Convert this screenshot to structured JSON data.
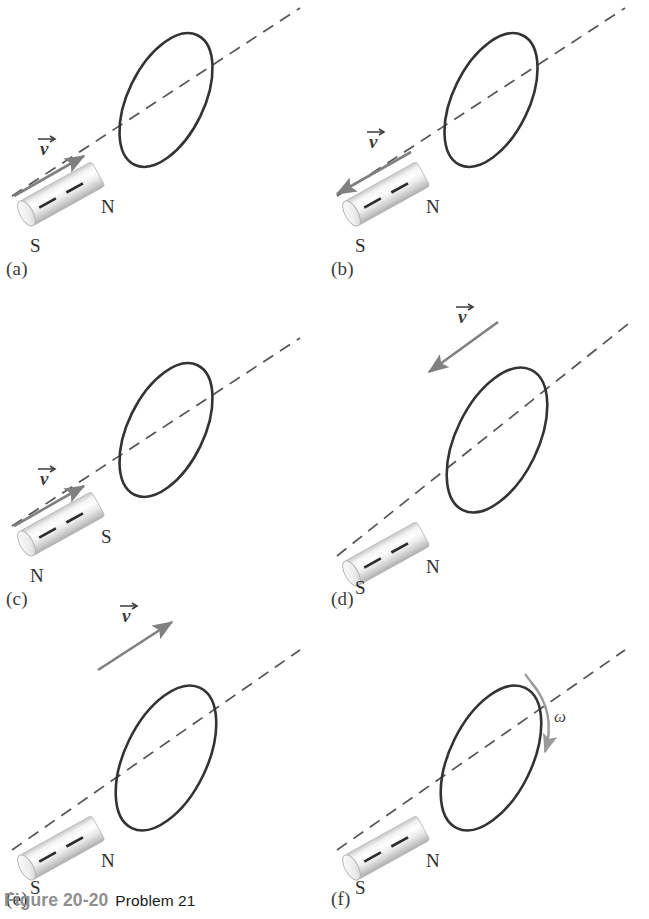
{
  "figure": {
    "caption_figure": "Figure 20-20",
    "caption_problem": "Problem 21",
    "caption_figure_color": "#8f8f8f",
    "caption_problem_color": "#1a1a1a"
  },
  "style": {
    "loop_color": "#333333",
    "axis_color": "#555555",
    "arrow_color": "#808080",
    "magnet_body_light": "#ffffff",
    "magnet_body_mid": "#e2e2e2",
    "magnet_body_dark": "#b5b5b5",
    "magnet_stripe": "#2b2b2b",
    "pole_label_color": "#2e2e2e",
    "panel_label_color": "#3b3b3b",
    "background": "#ffffff"
  },
  "symbols": {
    "velocity": "v",
    "omega": "ω",
    "pole_north": "N",
    "pole_south": "S"
  },
  "panels": [
    {
      "id": "a",
      "label": "(a)",
      "magnet": {
        "near_pole": "S",
        "far_pole": "N",
        "near_pole_label": "S",
        "far_pole_label": "N"
      },
      "motion": {
        "type": "velocity",
        "symbol": "v",
        "attached_to": "magnet",
        "direction": "toward-loop-up-right",
        "description": "Magnet moves toward the loop"
      },
      "loop": {
        "present": true,
        "moving": false
      }
    },
    {
      "id": "b",
      "label": "(b)",
      "magnet": {
        "near_pole": "S",
        "far_pole": "N",
        "near_pole_label": "S",
        "far_pole_label": "N"
      },
      "motion": {
        "type": "velocity",
        "symbol": "v",
        "attached_to": "magnet",
        "direction": "away-from-loop-down-left",
        "description": "Magnet moves away from the loop"
      },
      "loop": {
        "present": true,
        "moving": false
      }
    },
    {
      "id": "c",
      "label": "(c)",
      "magnet": {
        "near_pole": "N",
        "far_pole": "S",
        "near_pole_label": "N",
        "far_pole_label": "S"
      },
      "motion": {
        "type": "velocity",
        "symbol": "v",
        "attached_to": "magnet",
        "direction": "toward-loop-up-right",
        "description": "Reversed magnet moves toward the loop"
      },
      "loop": {
        "present": true,
        "moving": false
      }
    },
    {
      "id": "d",
      "label": "(d)",
      "magnet": {
        "near_pole": "S",
        "far_pole": "N",
        "near_pole_label": "S",
        "far_pole_label": "N"
      },
      "motion": {
        "type": "velocity",
        "symbol": "v",
        "attached_to": "loop",
        "direction": "toward-magnet-down-left",
        "description": "Loop moves toward the magnet"
      },
      "loop": {
        "present": true,
        "moving": true
      }
    },
    {
      "id": "e",
      "label": "(e)",
      "magnet": {
        "near_pole": "S",
        "far_pole": "N",
        "near_pole_label": "S",
        "far_pole_label": "N"
      },
      "motion": {
        "type": "velocity",
        "symbol": "v",
        "attached_to": "loop",
        "direction": "away-from-magnet-up-right",
        "description": "Loop moves away from the magnet"
      },
      "loop": {
        "present": true,
        "moving": true
      }
    },
    {
      "id": "f",
      "label": "(f)",
      "magnet": {
        "near_pole": "S",
        "far_pole": "N",
        "near_pole_label": "S",
        "far_pole_label": "N"
      },
      "motion": {
        "type": "angular-velocity",
        "symbol": "ω",
        "attached_to": "loop",
        "direction": "rotating-about-axis",
        "description": "Loop rotates about the axis"
      },
      "loop": {
        "present": true,
        "moving": false,
        "rotating": true
      }
    }
  ]
}
